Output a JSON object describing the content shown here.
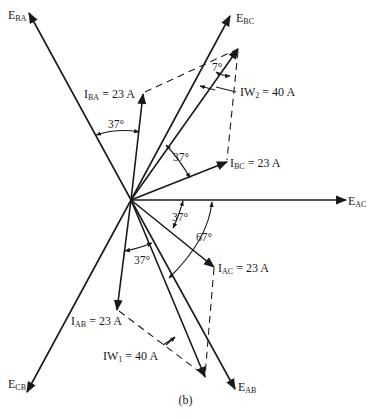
{
  "figure": {
    "panel_label": "(b)"
  },
  "voltages": [
    {
      "id": "E_BA",
      "main": "E",
      "sub": "BA"
    },
    {
      "id": "E_BC",
      "main": "E",
      "sub": "BC"
    },
    {
      "id": "E_AC",
      "main": "E",
      "sub": "AC"
    },
    {
      "id": "E_CB",
      "main": "E",
      "sub": "CB"
    },
    {
      "id": "E_AB",
      "main": "E",
      "sub": "AB"
    }
  ],
  "currents": [
    {
      "id": "I_BA",
      "main": "I",
      "sub": "BA",
      "value": " = 23 A"
    },
    {
      "id": "I_BC",
      "main": "I",
      "sub": "BC",
      "value": " = 23 A"
    },
    {
      "id": "I_AC",
      "main": "I",
      "sub": "AC",
      "value": " = 23 A"
    },
    {
      "id": "I_AB",
      "main": "I",
      "sub": "AB",
      "value": " = 23 A"
    },
    {
      "id": "IW_2",
      "main": "IW",
      "sub": "2",
      "value": " = 40 A"
    },
    {
      "id": "IW_1",
      "main": "IW",
      "sub": "1",
      "value": " = 40 A"
    }
  ],
  "angles": {
    "a1": "37°",
    "a2": "7°",
    "a3": "37°",
    "a4": "37°",
    "a5": "67°",
    "a6": "37°"
  },
  "colors": {
    "line": "#1a1a1a",
    "background": "#ffffff"
  }
}
